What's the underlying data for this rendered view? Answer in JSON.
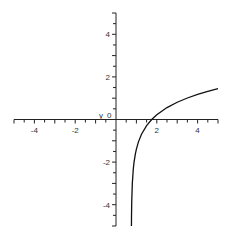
{
  "chart_data": {
    "type": "line",
    "title": "",
    "xlabel": "x",
    "ylabel": "y",
    "xlim": [
      -5,
      5
    ],
    "ylim": [
      -5,
      5
    ],
    "grid": false,
    "legend": null,
    "x_ticks": [
      -4,
      -2,
      2,
      4
    ],
    "y_ticks": [
      -4,
      -2,
      2,
      4
    ],
    "x_tick_labels": [
      "-4",
      "-2",
      "2",
      "4"
    ],
    "y_tick_labels": [
      "-4",
      "-2",
      "2",
      "4"
    ],
    "origin_label": "0",
    "minor_tick_step": 0.5,
    "series": [
      {
        "name": "f(x) ≈ ln(x - 0.75)",
        "color": "#111111",
        "x": [
          0.757,
          0.76,
          0.77,
          0.8,
          0.85,
          0.885,
          0.95,
          1.0,
          1.1,
          1.25,
          1.5,
          1.75,
          2.0,
          2.5,
          3.0,
          3.5,
          4.0,
          4.5,
          5.0
        ],
        "y": [
          -5.0,
          -4.6,
          -3.9,
          -3.0,
          -2.3,
          -2.0,
          -1.61,
          -1.39,
          -1.05,
          -0.69,
          -0.29,
          0.0,
          0.22,
          0.56,
          0.81,
          1.01,
          1.18,
          1.32,
          1.45
        ]
      }
    ]
  },
  "axes": {
    "x_axis_label": "x",
    "y_axis_label": "y",
    "origin_label": "0"
  }
}
